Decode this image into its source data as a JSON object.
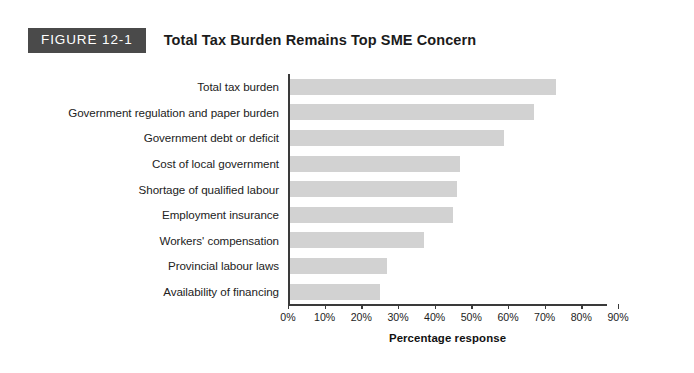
{
  "figure": {
    "badge_label": "FIGURE 12-1",
    "title": "Total Tax Burden Remains Top SME Concern"
  },
  "colors": {
    "badge_background": "#4a4a4a",
    "badge_text": "#ffffff",
    "bar_fill": "#d2d2d2",
    "axis_line": "#3a3a3a",
    "page_background": "#ffffff",
    "text": "#222222"
  },
  "chart_data": {
    "type": "bar",
    "orientation": "horizontal",
    "title": "Total Tax Burden Remains Top SME Concern",
    "xlabel": "Percentage response",
    "ylabel": "",
    "xlim": [
      0,
      90
    ],
    "grid": false,
    "legend": false,
    "categories": [
      "Total tax burden",
      "Government regulation and paper burden",
      "Government debt or deficit",
      "Cost of local government",
      "Shortage of qualified labour",
      "Employment insurance",
      "Workers' compensation",
      "Provincial labour laws",
      "Availability of financing"
    ],
    "values": [
      73,
      67,
      59,
      47,
      46,
      45,
      37,
      27,
      25
    ],
    "xticks": [
      0,
      10,
      20,
      30,
      40,
      50,
      60,
      70,
      80,
      90
    ],
    "xticklabels": [
      "0%",
      "10%",
      "20%",
      "30%",
      "40%",
      "50%",
      "60%",
      "70%",
      "80%",
      "90%"
    ]
  }
}
